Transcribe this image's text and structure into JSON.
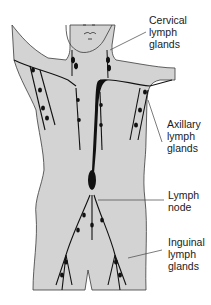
{
  "diagram": {
    "colors": {
      "body_fill": "#d3d3d3",
      "outline": "#3a3a3a",
      "vessels": "#111111",
      "background": "#ffffff"
    },
    "labels": [
      {
        "id": "cervical",
        "lines": [
          "Cervical",
          "lymph",
          "glands"
        ]
      },
      {
        "id": "axillary",
        "lines": [
          "Axillary",
          "lymph",
          "glands"
        ]
      },
      {
        "id": "node",
        "lines": [
          "Lymph",
          "node"
        ]
      },
      {
        "id": "inguinal",
        "lines": [
          "Inguinal",
          "lymph",
          "glands"
        ]
      }
    ]
  }
}
